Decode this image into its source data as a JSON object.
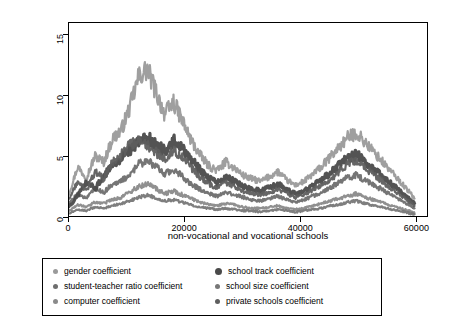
{
  "chart_data": {
    "type": "line",
    "title": "",
    "xlabel": "non-vocational and vocational schools",
    "ylabel": "",
    "xlim": [
      0,
      62000
    ],
    "ylim": [
      0,
      16
    ],
    "grid": false,
    "legend_position": "bottom",
    "x_ticks": [
      0,
      20000,
      40000,
      60000
    ],
    "x_tick_labels": [
      "0",
      "20000",
      "40000",
      "60000"
    ],
    "y_ticks": [
      0,
      5,
      10,
      15
    ],
    "y_tick_labels": [
      "0",
      "5",
      "10",
      "15"
    ],
    "series": [
      {
        "name": "gender coefficient",
        "color": "#9a9a9a",
        "marker": "small-dot",
        "x": [
          0,
          1500,
          3000,
          4500,
          6000,
          7500,
          9000,
          10500,
          12000,
          13500,
          15000,
          16500,
          18000,
          19500,
          21000,
          22500,
          24000,
          25500,
          27000,
          28500,
          30000,
          31500,
          33000,
          34500,
          36000,
          37500,
          39000,
          40500,
          42000,
          43500,
          45000,
          46500,
          48000,
          49500,
          51000,
          52500,
          54000,
          55500,
          57000,
          58500,
          59500
        ],
        "values": [
          2.0,
          4.2,
          3.3,
          5.1,
          4.6,
          6.5,
          7.2,
          9.1,
          11.6,
          12.2,
          10.3,
          8.5,
          9.5,
          8.0,
          6.4,
          5.2,
          4.3,
          3.9,
          4.6,
          4.1,
          3.5,
          3.2,
          3.0,
          3.4,
          3.8,
          3.1,
          2.7,
          3.0,
          3.6,
          4.2,
          5.0,
          5.8,
          6.6,
          7.0,
          6.2,
          5.4,
          4.6,
          3.8,
          3.0,
          2.2,
          1.6
        ]
      },
      {
        "name": "student-teacher ratio coefficient",
        "color": "#6e6e6e",
        "marker": "small-dot",
        "x": [
          0,
          1500,
          3000,
          4500,
          6000,
          7500,
          9000,
          10500,
          12000,
          13500,
          15000,
          16500,
          18000,
          19500,
          21000,
          22500,
          24000,
          25500,
          27000,
          28500,
          30000,
          31500,
          33000,
          34500,
          36000,
          37500,
          39000,
          40500,
          42000,
          43500,
          45000,
          46500,
          48000,
          49500,
          51000,
          52500,
          54000,
          55500,
          57000,
          58500,
          59500
        ],
        "values": [
          1.2,
          2.0,
          1.6,
          2.4,
          2.1,
          2.8,
          3.0,
          3.6,
          4.4,
          4.8,
          4.2,
          3.6,
          4.0,
          3.4,
          2.8,
          2.4,
          2.0,
          1.8,
          2.1,
          1.9,
          1.7,
          1.5,
          1.4,
          1.6,
          1.8,
          1.5,
          1.3,
          1.5,
          1.8,
          2.1,
          2.5,
          2.9,
          3.3,
          3.5,
          3.1,
          2.7,
          2.3,
          1.9,
          1.5,
          1.1,
          0.8
        ]
      },
      {
        "name": "computer coefficient",
        "color": "#8a8a8a",
        "marker": "small-dot",
        "x": [
          0,
          1500,
          3000,
          4500,
          6000,
          7500,
          9000,
          10500,
          12000,
          13500,
          15000,
          16500,
          18000,
          19500,
          21000,
          22500,
          24000,
          25500,
          27000,
          28500,
          30000,
          31500,
          33000,
          34500,
          36000,
          37500,
          39000,
          40500,
          42000,
          43500,
          45000,
          46500,
          48000,
          49500,
          51000,
          52500,
          54000,
          55500,
          57000,
          58500,
          59500
        ],
        "values": [
          0.6,
          1.1,
          0.9,
          1.3,
          1.2,
          1.5,
          1.7,
          2.1,
          2.6,
          2.8,
          2.4,
          2.0,
          2.2,
          1.9,
          1.6,
          1.3,
          1.1,
          1.0,
          1.2,
          1.1,
          0.9,
          0.8,
          0.8,
          0.9,
          1.0,
          0.8,
          0.7,
          0.8,
          1.0,
          1.2,
          1.4,
          1.6,
          1.8,
          2.0,
          1.7,
          1.5,
          1.3,
          1.0,
          0.8,
          0.6,
          0.4
        ]
      },
      {
        "name": "school track coefficient",
        "color": "#4a4a4a",
        "marker": "big-dot",
        "x": [
          0,
          1500,
          3000,
          4500,
          6000,
          7500,
          9000,
          10500,
          12000,
          13500,
          15000,
          16500,
          18000,
          19500,
          21000,
          22500,
          24000,
          25500,
          27000,
          28500,
          30000,
          31500,
          33000,
          34500,
          36000,
          37500,
          39000,
          40500,
          42000,
          43500,
          45000,
          46500,
          48000,
          49500,
          51000,
          52500,
          54000,
          55500,
          57000,
          58500,
          59500
        ],
        "values": [
          0.9,
          1.8,
          3.0,
          2.4,
          3.5,
          4.2,
          5.0,
          5.6,
          6.2,
          6.6,
          6.0,
          5.5,
          6.4,
          5.8,
          4.8,
          4.0,
          3.3,
          2.9,
          3.4,
          3.0,
          2.6,
          2.4,
          2.2,
          2.5,
          2.8,
          2.3,
          2.0,
          2.2,
          2.7,
          3.1,
          3.7,
          4.3,
          4.9,
          5.2,
          4.6,
          4.0,
          3.4,
          2.8,
          2.2,
          1.6,
          1.2
        ]
      },
      {
        "name": "school size coefficient",
        "color": "#777777",
        "marker": "small-dot",
        "x": [
          0,
          1500,
          3000,
          4500,
          6000,
          7500,
          9000,
          10500,
          12000,
          13500,
          15000,
          16500,
          18000,
          19500,
          21000,
          22500,
          24000,
          25500,
          27000,
          28500,
          30000,
          31500,
          33000,
          34500,
          36000,
          37500,
          39000,
          40500,
          42000,
          43500,
          45000,
          46500,
          48000,
          49500,
          51000,
          52500,
          54000,
          55500,
          57000,
          58500,
          59500
        ],
        "values": [
          0.4,
          0.7,
          0.6,
          0.9,
          0.8,
          1.0,
          1.2,
          1.4,
          1.7,
          1.9,
          1.6,
          1.4,
          1.5,
          1.3,
          1.1,
          0.9,
          0.8,
          0.7,
          0.8,
          0.7,
          0.6,
          0.6,
          0.5,
          0.6,
          0.7,
          0.6,
          0.5,
          0.6,
          0.7,
          0.8,
          1.0,
          1.1,
          1.3,
          1.4,
          1.2,
          1.0,
          0.9,
          0.7,
          0.6,
          0.4,
          0.3
        ]
      },
      {
        "name": "private schools coefficient",
        "color": "#5e5e5e",
        "marker": "small-dot",
        "x": [
          0,
          1500,
          3000,
          4500,
          6000,
          7500,
          9000,
          10500,
          12000,
          13500,
          15000,
          16500,
          18000,
          19500,
          21000,
          22500,
          24000,
          25500,
          27000,
          28500,
          30000,
          31500,
          33000,
          34500,
          36000,
          37500,
          39000,
          40500,
          42000,
          43500,
          45000,
          46500,
          48000,
          49500,
          51000,
          52500,
          54000,
          55500,
          57000,
          58500,
          59500
        ],
        "values": [
          1.5,
          3.0,
          2.2,
          3.8,
          3.2,
          4.6,
          5.2,
          6.0,
          6.4,
          6.0,
          5.4,
          4.8,
          5.6,
          5.0,
          4.2,
          3.4,
          2.8,
          2.5,
          2.9,
          2.6,
          2.2,
          2.0,
          1.9,
          2.1,
          2.4,
          2.0,
          1.7,
          1.9,
          2.3,
          2.7,
          3.2,
          3.8,
          4.4,
          4.7,
          4.1,
          3.6,
          3.0,
          2.4,
          1.9,
          1.4,
          1.0
        ]
      }
    ],
    "legend": [
      {
        "label": "gender coefficient",
        "color": "#9a9a9a",
        "marker": "small-dot"
      },
      {
        "label": "school track coefficient",
        "color": "#4a4a4a",
        "marker": "big-dot"
      },
      {
        "label": "student-teacher ratio coefficient",
        "color": "#6e6e6e",
        "marker": "small-dot"
      },
      {
        "label": "school size coefficient",
        "color": "#777777",
        "marker": "small-dot"
      },
      {
        "label": "computer coefficient",
        "color": "#8a8a8a",
        "marker": "small-dot"
      },
      {
        "label": "private schools coefficient",
        "color": "#5e5e5e",
        "marker": "small-dot"
      }
    ]
  }
}
